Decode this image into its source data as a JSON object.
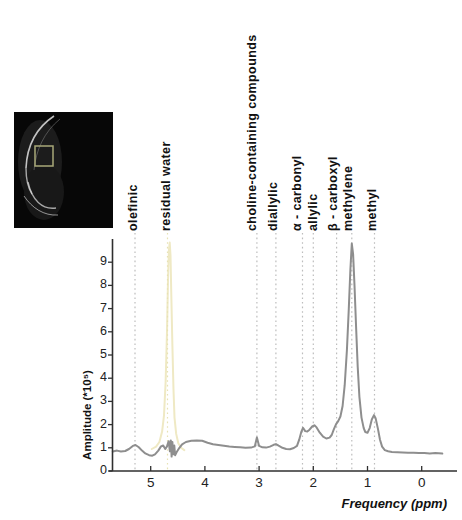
{
  "inset": {
    "name": "mri-localizer-image",
    "description": "axial MR localizer with spectroscopy voxel",
    "background_color": "#070707",
    "roi_box_color": "#a8a878"
  },
  "chart_data": {
    "type": "line",
    "title": "",
    "xlabel": "Frequency (ppm)",
    "ylabel": "Amplitude (*10⁵)",
    "x_axis": {
      "min": -0.65,
      "max": 5.77,
      "reversed": true,
      "tick_values": [
        5,
        4,
        3,
        2,
        1,
        0
      ],
      "tick_labels": [
        "5",
        "4",
        "3",
        "2",
        "1",
        "0"
      ]
    },
    "y_axis": {
      "min": 0,
      "max": 9.95,
      "tick_values": [
        0,
        1,
        2,
        3,
        4,
        5,
        6,
        7,
        8,
        9
      ],
      "tick_labels": [
        "0",
        "1",
        "2",
        "3",
        "4",
        "5",
        "6",
        "7",
        "8",
        "9"
      ]
    },
    "grid": false,
    "legend": "none",
    "peak_labels": [
      {
        "id": "olefinic",
        "label": "olefinic",
        "ppm": 5.29,
        "line_color": "#bdbdbd"
      },
      {
        "id": "residual-water",
        "label": "residual water",
        "ppm": 4.69,
        "line_color": "#e7e2b4"
      },
      {
        "id": "choline-containing-compounds",
        "label": "choline-containing compounds",
        "ppm": 3.04,
        "line_color": "#bdbdbd"
      },
      {
        "id": "diallylic",
        "label": "diallylic",
        "ppm": 2.69,
        "line_color": "#bdbdbd"
      },
      {
        "id": "alpha-carbonyl",
        "label": "α - carbonyl",
        "ppm": 2.2,
        "line_color": "#bdbdbd"
      },
      {
        "id": "allylic",
        "label": "allylic",
        "ppm": 2.0,
        "line_color": "#bdbdbd"
      },
      {
        "id": "beta-carboxyl",
        "label": "β - carboxyl",
        "ppm": 1.57,
        "line_color": "#bdbdbd"
      },
      {
        "id": "methylene",
        "label": "methylene",
        "ppm": 1.29,
        "line_color": "#bdbdbd"
      },
      {
        "id": "methyl",
        "label": "methyl",
        "ppm": 0.87,
        "line_color": "#bdbdbd"
      }
    ],
    "series": [
      {
        "name": "residual-water-reference-trace",
        "color": "#efe9c4",
        "width": 2,
        "points": [
          [
            4.98,
            0.95
          ],
          [
            4.9,
            1.05
          ],
          [
            4.84,
            1.25
          ],
          [
            4.79,
            1.7
          ],
          [
            4.755,
            2.4
          ],
          [
            4.725,
            3.8
          ],
          [
            4.7,
            6.0
          ],
          [
            4.68,
            8.2
          ],
          [
            4.665,
            9.5
          ],
          [
            4.65,
            9.85
          ],
          [
            4.635,
            9.3
          ],
          [
            4.62,
            7.6
          ],
          [
            4.6,
            5.4
          ],
          [
            4.58,
            3.5
          ],
          [
            4.56,
            2.3
          ],
          [
            4.53,
            1.6
          ],
          [
            4.49,
            1.2
          ],
          [
            4.44,
            1.0
          ],
          [
            4.38,
            0.9
          ]
        ]
      },
      {
        "name": "mr-spectrum",
        "color": "#8e8e8e",
        "width": 2,
        "points": [
          [
            5.7,
            0.84
          ],
          [
            5.62,
            0.88
          ],
          [
            5.55,
            0.84
          ],
          [
            5.47,
            0.86
          ],
          [
            5.4,
            0.95
          ],
          [
            5.33,
            1.08
          ],
          [
            5.28,
            1.12
          ],
          [
            5.22,
            1.02
          ],
          [
            5.16,
            0.88
          ],
          [
            5.1,
            0.76
          ],
          [
            5.03,
            0.68
          ],
          [
            4.97,
            0.66
          ],
          [
            4.92,
            0.72
          ],
          [
            4.86,
            0.88
          ],
          [
            4.81,
            1.06
          ],
          [
            4.77,
            1.1
          ],
          [
            4.73,
            0.95
          ],
          [
            4.7,
            1.06
          ],
          [
            4.67,
            1.28
          ],
          [
            4.645,
            0.85
          ],
          [
            4.63,
            1.32
          ],
          [
            4.615,
            0.62
          ],
          [
            4.6,
            1.25
          ],
          [
            4.585,
            0.72
          ],
          [
            4.565,
            1.1
          ],
          [
            4.55,
            0.68
          ],
          [
            4.52,
            0.82
          ],
          [
            4.47,
            1.0
          ],
          [
            4.42,
            1.15
          ],
          [
            4.35,
            1.25
          ],
          [
            4.25,
            1.3
          ],
          [
            4.15,
            1.32
          ],
          [
            4.05,
            1.3
          ],
          [
            3.95,
            1.22
          ],
          [
            3.85,
            1.15
          ],
          [
            3.75,
            1.12
          ],
          [
            3.65,
            1.09
          ],
          [
            3.55,
            1.06
          ],
          [
            3.45,
            1.04
          ],
          [
            3.35,
            1.02
          ],
          [
            3.25,
            1.0
          ],
          [
            3.15,
            1.01
          ],
          [
            3.08,
            1.06
          ],
          [
            3.04,
            1.45
          ],
          [
            3.0,
            1.08
          ],
          [
            2.94,
            1.02
          ],
          [
            2.87,
            1.01
          ],
          [
            2.8,
            1.05
          ],
          [
            2.73,
            1.13
          ],
          [
            2.69,
            1.16
          ],
          [
            2.64,
            1.09
          ],
          [
            2.57,
            1.0
          ],
          [
            2.5,
            0.95
          ],
          [
            2.43,
            0.94
          ],
          [
            2.36,
            0.99
          ],
          [
            2.3,
            1.08
          ],
          [
            2.26,
            1.35
          ],
          [
            2.22,
            1.7
          ],
          [
            2.19,
            1.86
          ],
          [
            2.15,
            1.72
          ],
          [
            2.11,
            1.7
          ],
          [
            2.07,
            1.78
          ],
          [
            2.02,
            1.92
          ],
          [
            1.98,
            1.97
          ],
          [
            1.94,
            1.88
          ],
          [
            1.88,
            1.65
          ],
          [
            1.82,
            1.48
          ],
          [
            1.76,
            1.4
          ],
          [
            1.7,
            1.44
          ],
          [
            1.66,
            1.55
          ],
          [
            1.62,
            1.8
          ],
          [
            1.58,
            2.02
          ],
          [
            1.54,
            2.15
          ],
          [
            1.5,
            2.35
          ],
          [
            1.46,
            2.8
          ],
          [
            1.42,
            3.7
          ],
          [
            1.38,
            5.2
          ],
          [
            1.345,
            7.0
          ],
          [
            1.315,
            8.7
          ],
          [
            1.29,
            9.8
          ],
          [
            1.265,
            9.35
          ],
          [
            1.24,
            8.0
          ],
          [
            1.21,
            6.2
          ],
          [
            1.18,
            4.5
          ],
          [
            1.15,
            3.2
          ],
          [
            1.11,
            2.3
          ],
          [
            1.07,
            1.85
          ],
          [
            1.04,
            1.68
          ],
          [
            1.0,
            1.65
          ],
          [
            0.96,
            1.85
          ],
          [
            0.92,
            2.22
          ],
          [
            0.88,
            2.41
          ],
          [
            0.85,
            2.28
          ],
          [
            0.81,
            1.85
          ],
          [
            0.77,
            1.35
          ],
          [
            0.73,
            1.05
          ],
          [
            0.68,
            0.9
          ],
          [
            0.62,
            0.85
          ],
          [
            0.55,
            0.82
          ],
          [
            0.45,
            0.81
          ],
          [
            0.35,
            0.8
          ],
          [
            0.25,
            0.79
          ],
          [
            0.15,
            0.79
          ],
          [
            0.05,
            0.77
          ],
          [
            -0.05,
            0.78
          ],
          [
            -0.15,
            0.76
          ],
          [
            -0.25,
            0.77
          ],
          [
            -0.38,
            0.75
          ]
        ]
      }
    ],
    "axis_color": "#2f2f2f"
  }
}
